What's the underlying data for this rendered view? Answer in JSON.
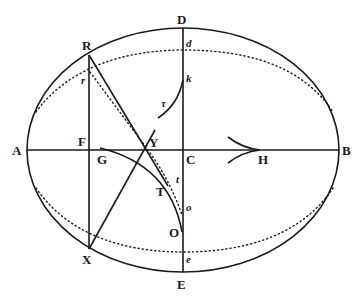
{
  "figure": {
    "type": "geometric construction",
    "outer_ellipse": {
      "cx": 183,
      "cy": 150,
      "rx": 156,
      "ry": 122,
      "style": "solid"
    },
    "inner_ellipse": {
      "cx": 183,
      "cy": 150,
      "rx": 154,
      "ry": 100,
      "style": "dotted"
    },
    "labels": {
      "A": "A",
      "B": "B",
      "C": "C",
      "D": "D",
      "E": "E",
      "F": "F",
      "G": "G",
      "H": "H",
      "R": "R",
      "X": "X",
      "Y": "Y",
      "T": "T",
      "O": "O",
      "r": "r",
      "d": "d",
      "k": "k",
      "tau": "τ",
      "t": "t",
      "o": "o",
      "e": "e"
    }
  }
}
